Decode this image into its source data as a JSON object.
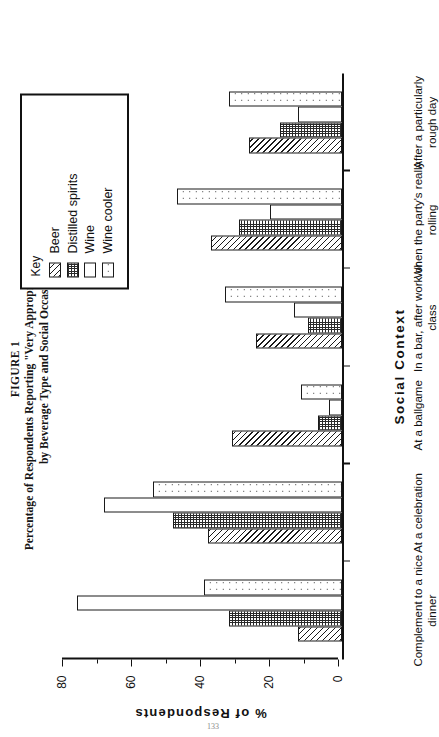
{
  "figure": {
    "number_label": "FIGURE 1",
    "caption_line1": "Percentage of Respondents Reporting \"Very Appropriate\" Consumption,",
    "caption_line2": "by Beverage Type and Social Occasion",
    "page_number": "133"
  },
  "legend": {
    "title": "Key",
    "items": [
      {
        "label": "Beer",
        "pattern": "diagonal-hatch"
      },
      {
        "label": "Distilled spirits",
        "pattern": "dense-grid"
      },
      {
        "label": "Wine",
        "pattern": "blank"
      },
      {
        "label": "Wine cooler",
        "pattern": "sparse-dots"
      }
    ]
  },
  "axes": {
    "value_axis_title": "%  of  Respondents",
    "category_axis_title": "Social   Context",
    "value_ticks": [
      "0",
      "20",
      "40",
      "60",
      "80"
    ],
    "value_min": 0,
    "value_max": 80
  },
  "chart_data": {
    "type": "bar",
    "title": "Percentage of Respondents Reporting \"Very Appropriate\" Consumption, by Beverage Type and Social Occasion",
    "xlabel": "Social Context",
    "ylabel": "% of Respondents",
    "ylim": [
      0,
      80
    ],
    "grid": false,
    "legend_position": "top-right",
    "orientation": "vertical-bars-printed-sideways",
    "categories": [
      "Complement to a nice dinner",
      "At a celebration",
      "At a ballgame",
      "In a bar, after work or class",
      "When the party's really rolling",
      "After a particularly rough day"
    ],
    "series": [
      {
        "name": "Beer",
        "values": [
          13,
          39,
          32,
          25,
          38,
          27
        ]
      },
      {
        "name": "Distilled spirits",
        "values": [
          33,
          49,
          7,
          10,
          30,
          18
        ]
      },
      {
        "name": "Wine",
        "values": [
          77,
          69,
          4,
          14,
          21,
          13
        ]
      },
      {
        "name": "Wine cooler",
        "values": [
          40,
          55,
          12,
          34,
          48,
          33
        ]
      }
    ]
  }
}
